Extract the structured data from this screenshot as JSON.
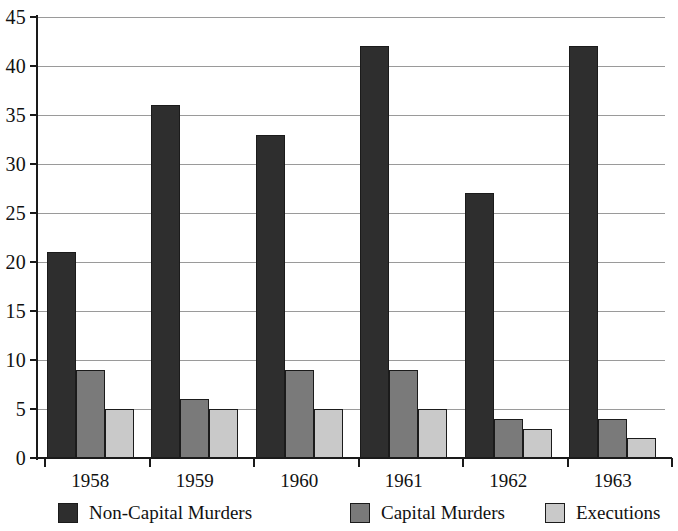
{
  "chart_data": {
    "type": "bar",
    "title": "",
    "subtitle": "",
    "xlabel": "",
    "ylabel": "",
    "categories": [
      "1958",
      "1959",
      "1960",
      "1961",
      "1962",
      "1963"
    ],
    "series": [
      {
        "name": "Non-Capital Murders",
        "color": "#2e2e2e",
        "values": [
          21,
          36,
          33,
          42,
          27,
          42
        ]
      },
      {
        "name": "Capital Murders",
        "color": "#7a7a7a",
        "values": [
          9,
          6,
          9,
          9,
          4,
          4
        ]
      },
      {
        "name": "Executions",
        "color": "#c9c9c9",
        "values": [
          5,
          5,
          5,
          5,
          3,
          2
        ]
      }
    ],
    "ylim": [
      0,
      45
    ],
    "y_ticks": [
      0,
      5,
      10,
      15,
      20,
      25,
      30,
      35,
      40,
      45
    ],
    "y_tick_labels": [
      "0",
      "5",
      "10",
      "15",
      "20",
      "25",
      "30",
      "35",
      "40",
      "45"
    ],
    "grid": true,
    "grid_axis": "y",
    "legend_position": "bottom",
    "bar_orientation": "vertical",
    "grouping": "grouped"
  },
  "legend": {
    "items": [
      {
        "label": "Non-Capital Murders",
        "color": "#2e2e2e"
      },
      {
        "label": "Capital Murders",
        "color": "#7a7a7a"
      },
      {
        "label": "Executions",
        "color": "#c9c9c9"
      }
    ]
  }
}
